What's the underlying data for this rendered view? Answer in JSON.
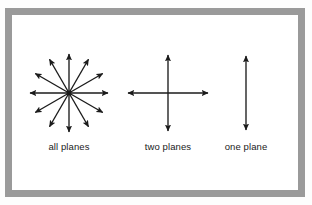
{
  "figure": {
    "background_color": "#ffffff",
    "frame_color": "#9a9a9a",
    "stroke_color": "#1b1b1b",
    "title": "",
    "panels": [
      {
        "id": "all-planes",
        "label": "all planes",
        "icon": "radial-double-arrow-star-icon",
        "center_x": 69,
        "center_y": 93,
        "radius": 39,
        "arm_count": 12,
        "angle_step_deg": 30,
        "arrowhead": "filled-triangle",
        "label_x": 69,
        "label_y": 141
      },
      {
        "id": "two-planes",
        "label": "two planes",
        "icon": "cross-double-arrow-icon",
        "center_x": 168,
        "center_y": 93,
        "half_length_x": 40,
        "half_length_y": 38,
        "arm_count": 4,
        "arrowhead": "filled-triangle",
        "label_x": 168,
        "label_y": 141
      },
      {
        "id": "one-plane",
        "label": "one plane",
        "icon": "vertical-double-arrow-icon",
        "center_x": 246,
        "center_y": 93,
        "half_length_y": 37,
        "arm_count": 2,
        "arrowhead": "filled-triangle",
        "label_x": 246,
        "label_y": 141
      }
    ]
  },
  "chart_data": {
    "type": "diagram",
    "title": "",
    "subtitle": "",
    "xlabel": "",
    "ylabel": "",
    "categories": [
      "all planes",
      "two planes",
      "one plane"
    ],
    "values": [
      12,
      4,
      2
    ],
    "value_meaning": "number of double-arrow directions drawn in each panel",
    "annotations": [
      "all planes",
      "two planes",
      "one plane"
    ],
    "legend_position": "none",
    "grid": false
  }
}
